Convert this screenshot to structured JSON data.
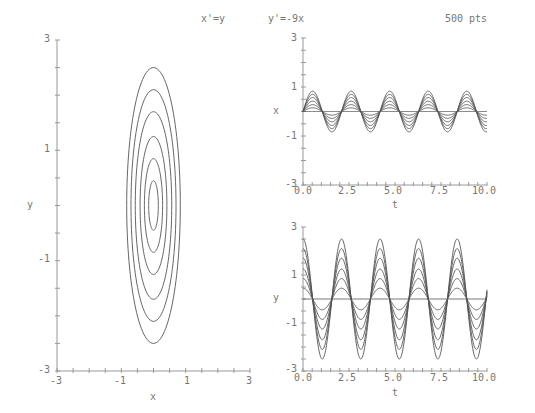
{
  "header": {
    "eq_x": "x'=y",
    "eq_y": "y'=-9x",
    "points": "500 pts"
  },
  "colors": {
    "axis": "#999999",
    "curve": "#555555",
    "text": "#777777"
  },
  "chart_data": [
    {
      "id": "phase",
      "type": "line",
      "title": "",
      "xlabel": "x",
      "ylabel": "y",
      "xlim": [
        -3,
        3
      ],
      "ylim": [
        -3,
        3
      ],
      "xticks": [
        "-3",
        "-1",
        "1",
        "3"
      ],
      "yticks": [
        "3",
        "1",
        "-1",
        "-3"
      ],
      "grid": false,
      "series_description": "Closed elliptical orbits centered at origin, y amplitude = 3 × x amplitude",
      "y_amplitudes": [
        2.5,
        2.1,
        1.7,
        1.25,
        0.85,
        0.45
      ]
    },
    {
      "id": "x_vs_t",
      "type": "line",
      "xlabel": "t",
      "ylabel": "x",
      "xlim": [
        0,
        10
      ],
      "ylim": [
        -3,
        3
      ],
      "xticks": [
        "0.0",
        "2.5",
        "5.0",
        "7.5",
        "10.0"
      ],
      "yticks": [
        "3",
        "1",
        "-1",
        "-3"
      ],
      "function": "x = a*sin(3t)",
      "amplitudes": [
        0,
        0.15,
        0.28,
        0.42,
        0.57,
        0.7,
        0.83
      ]
    },
    {
      "id": "y_vs_t",
      "type": "line",
      "xlabel": "t",
      "ylabel": "y",
      "xlim": [
        0,
        10
      ],
      "ylim": [
        -3,
        3
      ],
      "xticks": [
        "0.0",
        "2.5",
        "5.0",
        "7.5",
        "10.0"
      ],
      "yticks": [
        "3",
        "1",
        "-1",
        "-3"
      ],
      "function": "y = 3a*cos(3t)",
      "amplitudes": [
        0,
        0.45,
        0.85,
        1.25,
        1.7,
        2.1,
        2.5
      ]
    }
  ]
}
